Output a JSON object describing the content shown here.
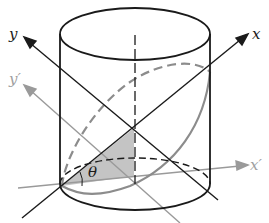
{
  "figure": {
    "labels": {
      "y": "y",
      "x": "x",
      "y_prime": "y′",
      "x_prime": "x′",
      "theta": "θ"
    },
    "colors": {
      "line": "#1a1a1a",
      "gray_axis": "#9a9a9a",
      "ellipse_cut": "#8c8c8c",
      "shade": "#c4c4c4"
    }
  }
}
